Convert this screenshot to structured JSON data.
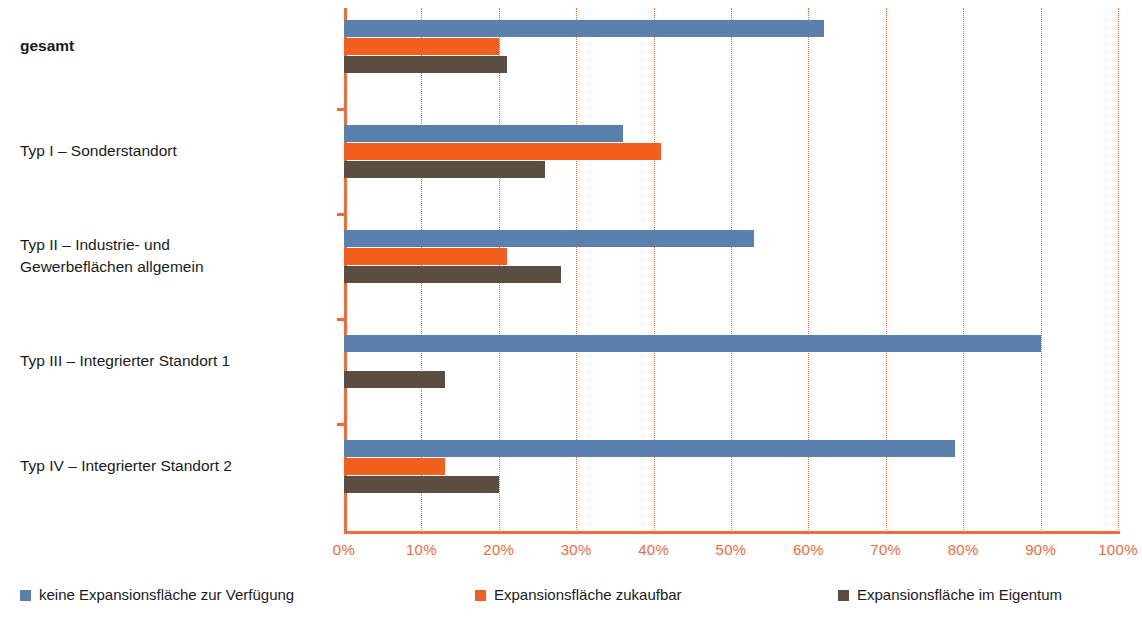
{
  "chart_data": {
    "type": "bar",
    "orientation": "horizontal",
    "title": "",
    "subtitle": "",
    "xlabel": "",
    "ylabel": "",
    "xlim": [
      0,
      100
    ],
    "xticks": [
      "0%",
      "10%",
      "20%",
      "30%",
      "40%",
      "50%",
      "60%",
      "70%",
      "80%",
      "90%",
      "100%"
    ],
    "xtick_values": [
      0,
      10,
      20,
      30,
      40,
      50,
      60,
      70,
      80,
      90,
      100
    ],
    "grid": true,
    "grid_style": "dotted-vertical",
    "legend_position": "bottom",
    "categories": [
      "gesamt",
      "Typ I – Sonderstandort",
      "Typ II – Industrie- und Gewerbeflächen allgemein",
      "Typ III – Integrierter Standort 1",
      "Typ IV – Integrierter Standort 2"
    ],
    "category_lines": [
      [
        "gesamt"
      ],
      [
        "Typ I – Sonderstandort"
      ],
      [
        "Typ II – Industrie- und",
        "Gewerbeflächen allgemein"
      ],
      [
        "Typ III – Integrierter Standort 1"
      ],
      [
        "Typ IV – Integrierter Standort 2"
      ]
    ],
    "series": [
      {
        "name": "keine Expansionsfläche zur Verfügung",
        "color": "#5b80ad",
        "values": [
          62,
          36,
          53,
          90,
          79
        ]
      },
      {
        "name": "Expansionsfläche zukaufbar",
        "color": "#f2601f",
        "values": [
          20,
          41,
          21,
          0,
          13
        ]
      },
      {
        "name": "Expansionsfläche im Eigentum",
        "color": "#5c4d42",
        "values": [
          21,
          26,
          28,
          13,
          20
        ]
      }
    ]
  },
  "axis": {
    "color": "#ef6b3b",
    "tick_label_color": "#ef6b3b"
  },
  "legend": {
    "items": [
      {
        "label": "keine Expansionsfläche zur Verfügung",
        "color": "#5b80ad"
      },
      {
        "label": "Expansionsfläche zukaufbar",
        "color": "#f2601f"
      },
      {
        "label": "Expansionsfläche im Eigentum",
        "color": "#5c4d42"
      }
    ]
  }
}
